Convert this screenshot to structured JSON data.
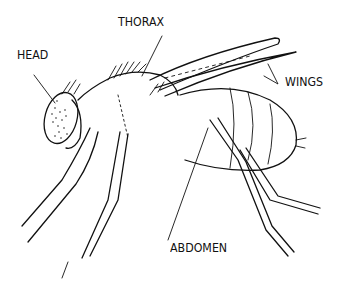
{
  "diagram": {
    "labels": {
      "head": "HEAD",
      "thorax": "THORAX",
      "wings": "WINGS",
      "abdomen": "ABDOMEN"
    }
  }
}
